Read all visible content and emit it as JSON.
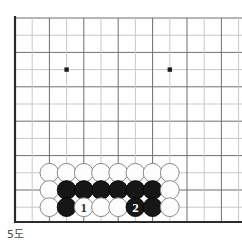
{
  "figure": {
    "caption": "5도",
    "kind": "go-board-corner-diagram"
  },
  "board": {
    "edge_color": "#2b2b2b",
    "grid_color": "#6e6e6e",
    "grid_faint_color": "#c9c9c9",
    "background_color": "#ffffff",
    "origin_x": 15,
    "origin_y": 18,
    "bottom_y": 222,
    "spacing": 17.2,
    "cols": 14,
    "rows": 12,
    "star_points": [
      {
        "col": 3,
        "row": 3
      },
      {
        "col": 9,
        "row": 3
      },
      {
        "col": 3,
        "row": 9
      },
      {
        "col": 9,
        "row": 9
      }
    ],
    "star_radius": 2.2
  },
  "stones": {
    "radius": 9.4,
    "black_fill": "#161616",
    "white_fill": "#fdfdfd",
    "white_stroke": "#8a8a8a",
    "black_stroke": "#000000",
    "label_on_black_color": "#ffffff",
    "label_on_white_color": "#333333",
    "rows": [
      {
        "name": "row-upper",
        "row": 9,
        "items": [
          {
            "col": 2,
            "color": "white",
            "label": ""
          },
          {
            "col": 3,
            "color": "white",
            "label": ""
          },
          {
            "col": 4,
            "color": "white",
            "label": ""
          },
          {
            "col": 5,
            "color": "white",
            "label": ""
          },
          {
            "col": 6,
            "color": "white",
            "label": ""
          },
          {
            "col": 7,
            "color": "white",
            "label": ""
          },
          {
            "col": 8,
            "color": "white",
            "label": ""
          },
          {
            "col": 9,
            "color": "white",
            "label": ""
          }
        ]
      },
      {
        "name": "row-middle",
        "row": 10,
        "items": [
          {
            "col": 2,
            "color": "white",
            "label": ""
          },
          {
            "col": 3,
            "color": "black",
            "label": ""
          },
          {
            "col": 4,
            "color": "black",
            "label": ""
          },
          {
            "col": 5,
            "color": "black",
            "label": ""
          },
          {
            "col": 6,
            "color": "black",
            "label": ""
          },
          {
            "col": 7,
            "color": "black",
            "label": ""
          },
          {
            "col": 8,
            "color": "black",
            "label": ""
          },
          {
            "col": 9,
            "color": "white",
            "label": ""
          }
        ]
      },
      {
        "name": "row-lower",
        "row": 11,
        "items": [
          {
            "col": 2,
            "color": "white",
            "label": ""
          },
          {
            "col": 3,
            "color": "black",
            "label": ""
          },
          {
            "col": 4,
            "color": "white",
            "label": "1"
          },
          {
            "col": 5,
            "color": "white",
            "label": ""
          },
          {
            "col": 6,
            "color": "white",
            "label": ""
          },
          {
            "col": 7,
            "color": "black",
            "label": "2"
          },
          {
            "col": 8,
            "color": "black",
            "label": ""
          },
          {
            "col": 9,
            "color": "white",
            "label": ""
          }
        ]
      }
    ]
  }
}
